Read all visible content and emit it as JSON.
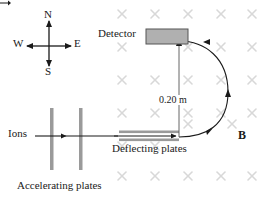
{
  "figure": {
    "background_color": "#ffffff",
    "width": 261,
    "height": 201
  },
  "compass": {
    "north": "N",
    "south": "S",
    "west": "W",
    "east": "E"
  },
  "labels": {
    "detector": "Detector",
    "ions": "Ions",
    "deflecting_plates": "Deflecting plates",
    "accelerating_plates": "Accelerating plates",
    "dimension": "0.20 m",
    "magnetic_field": "B"
  },
  "colors": {
    "line": "#1a1a1a",
    "plate_gray": "#9a9a9a",
    "detector_fill": "#b0b0b0",
    "detector_stroke": "#555555",
    "field_mark": "#d8d8d8",
    "text": "#1a1a1a"
  },
  "field_marks": {
    "symbol": "x",
    "meaning": "magnetic-field-into-page",
    "columns_x": [
      122,
      155,
      188,
      221,
      252
    ],
    "rows_y": [
      14,
      47,
      80,
      113,
      146,
      179
    ]
  }
}
